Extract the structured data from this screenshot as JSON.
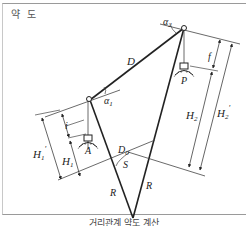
{
  "title": "약 도",
  "caption": "거리관계 약도 계산",
  "labels": {
    "alpha1": "α",
    "alpha1_sub": "1",
    "alpha2": "α",
    "alpha2_sub": "2",
    "D": "D",
    "D0": "D",
    "D0_sub": "0",
    "P": "P",
    "A": "A",
    "f": "f",
    "i": "i",
    "H1": "H",
    "H1_sub": "1",
    "H1p": "H",
    "H1p_sub": "1",
    "H1p_prime": "′",
    "H2": "H",
    "H2_sub": "2",
    "H2p": "H",
    "H2p_sub": "2",
    "H2p_prime": "′",
    "S": "S",
    "R_left": "R",
    "R_right": "R"
  },
  "colors": {
    "line": "#222222",
    "thin_line": "#444444",
    "frame": "#9a9a9a"
  }
}
